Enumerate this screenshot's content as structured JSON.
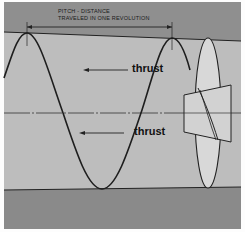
{
  "diagram": {
    "title_line1": "PITCH - DISTANCE",
    "title_line2": "TRAVELED IN ONE REVOLUTION",
    "labels": [
      {
        "text": "thrust",
        "direction": "left"
      },
      {
        "text": "thrust",
        "direction": "left"
      }
    ],
    "colors": {
      "band": "#8c8c8c",
      "field": "#bdbdbd",
      "propeller": "#d6d6d6",
      "line": "#222222"
    }
  }
}
